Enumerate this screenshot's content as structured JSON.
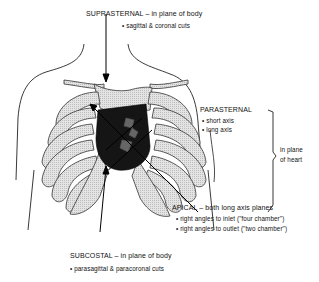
{
  "labels": {
    "suprasternal": {
      "title": "SUPRASTERNAL – in plane of body",
      "bullets": [
        "• sagittal & coronal cuts"
      ]
    },
    "parasternal": {
      "title": "PARASTERNAL",
      "bullets": [
        "• short axis",
        "• long axis"
      ]
    },
    "heart_plane": {
      "line1": "in plane",
      "line2": "of heart"
    },
    "apical": {
      "title": "APICAL – both long axis planes",
      "bullets": [
        "• right angles to inlet (\"four chamber\")",
        "• right angles to outlet (\"two chamber\")"
      ]
    },
    "subcostal": {
      "title": "SUBCOSTAL – in plane of body",
      "bullets": [
        "• parasagittal & paracoronal cuts"
      ]
    }
  },
  "colors": {
    "ink": "#111111",
    "bone_fill": "#d8d8d8",
    "heart_fill": "#1a1a1a"
  }
}
